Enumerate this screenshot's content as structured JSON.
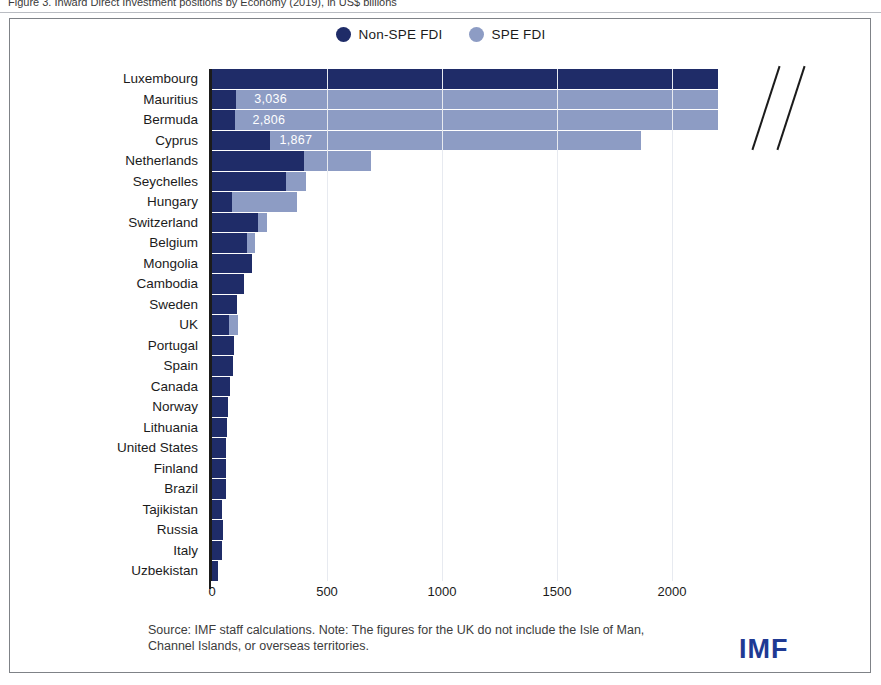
{
  "figure_caption": "Figure 3. Inward Direct Investment positions by Economy (2019), in US$ billions",
  "legend": {
    "items": [
      {
        "label": "Non-SPE FDI",
        "color": "#1f2c68",
        "icon": "circle-icon"
      },
      {
        "label": "SPE FDI",
        "color": "#8d9cc4",
        "icon": "circle-icon"
      }
    ]
  },
  "footnote": "Source: IMF staff calculations. Note: The figures for the UK do not include the Isle of Man, Channel Islands, or overseas territories.",
  "logo": "IMF",
  "chart_data": {
    "type": "bar",
    "orientation": "horizontal",
    "stacked": true,
    "title": "",
    "xlabel": "",
    "ylabel": "",
    "xlim": [
      0,
      2200
    ],
    "xticks": [
      0,
      500,
      1000,
      1500,
      2000
    ],
    "xtick_labels": [
      "0",
      "500",
      "1000",
      "1500",
      "2000"
    ],
    "grid": false,
    "axis_break": true,
    "axis_break_note": "Top four bars exceed the axis range; values shown as data labels",
    "legend_position": "top-center",
    "categories": [
      "Luxembourg",
      "Mauritius",
      "Bermuda",
      "Cyprus",
      "Netherlands",
      "Seychelles",
      "Hungary",
      "Switzerland",
      "Belgium",
      "Mongolia",
      "Cambodia",
      "Sweden",
      "UK",
      "Portugal",
      "Spain",
      "Canada",
      "Norway",
      "Lithuania",
      "United States",
      "Finland",
      "Brazil",
      "Tajikistan",
      "Russia",
      "Italy",
      "Uzbekistan"
    ],
    "series": [
      {
        "name": "Non-SPE FDI",
        "color": "#1f2c68",
        "values": [
          2395,
          105,
          98,
          250,
          400,
          320,
          85,
          200,
          150,
          175,
          140,
          110,
          75,
          95,
          90,
          80,
          70,
          65,
          62,
          62,
          60,
          45,
          48,
          42,
          28
        ]
      },
      {
        "name": "SPE FDI",
        "color": "#8d9cc4",
        "values": [
          2191,
          2931,
          2708,
          1617,
          290,
          90,
          285,
          40,
          35,
          0,
          0,
          0,
          40,
          0,
          0,
          0,
          0,
          0,
          0,
          0,
          0,
          0,
          0,
          0,
          0
        ]
      }
    ],
    "totals": [
      4586,
      3036,
      2806,
      1867,
      690,
      410,
      370,
      240,
      185,
      175,
      140,
      110,
      115,
      95,
      90,
      80,
      70,
      65,
      62,
      62,
      60,
      45,
      48,
      42,
      28
    ],
    "data_labels": [
      {
        "category": "Luxembourg",
        "text": "4,586"
      },
      {
        "category": "Mauritius",
        "text": "3,036"
      },
      {
        "category": "Bermuda",
        "text": "2,806"
      },
      {
        "category": "Cyprus",
        "text": "1,867"
      }
    ]
  }
}
